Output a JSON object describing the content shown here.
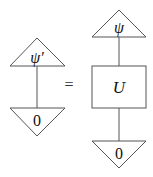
{
  "diagram": {
    "left": {
      "top_state_label": "ψ′",
      "bottom_effect_label": "0"
    },
    "relation": "=",
    "right": {
      "top_state_label": "ψ",
      "gate_label": "U",
      "bottom_effect_label": "0"
    }
  }
}
